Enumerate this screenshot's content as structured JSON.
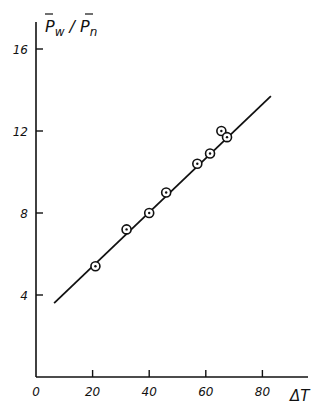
{
  "chart_data": {
    "type": "scatter",
    "title": "",
    "xlabel": "ΔT",
    "ylabel": "P̄w/P̄n",
    "ylabel_parts": {
      "num": "P",
      "num_sub": "w",
      "den": "P",
      "den_sub": "n"
    },
    "xlim": [
      0,
      90
    ],
    "ylim": [
      0,
      17
    ],
    "grid": false,
    "legend": null,
    "x_ticks": [
      0,
      20,
      40,
      60,
      80
    ],
    "x_tick_labels": [
      "0",
      "20",
      "40",
      "60",
      "80"
    ],
    "y_ticks": [
      4,
      8,
      12,
      16
    ],
    "y_tick_labels": [
      "4",
      "8",
      "12",
      "16"
    ],
    "series": [
      {
        "name": "measured",
        "marker": "circle-dot",
        "points": [
          {
            "x": 21,
            "y": 5.4
          },
          {
            "x": 32,
            "y": 7.2
          },
          {
            "x": 40,
            "y": 8.0
          },
          {
            "x": 46,
            "y": 9.0
          },
          {
            "x": 57,
            "y": 10.4
          },
          {
            "x": 61.5,
            "y": 10.9
          },
          {
            "x": 65.5,
            "y": 12.0
          },
          {
            "x": 67.5,
            "y": 11.7
          }
        ]
      },
      {
        "name": "fit",
        "marker": "line",
        "points": [
          {
            "x": 6.4,
            "y": 3.6
          },
          {
            "x": 83,
            "y": 13.7
          }
        ]
      }
    ]
  },
  "colors": {
    "ink": "#111111",
    "background": "#ffffff"
  }
}
